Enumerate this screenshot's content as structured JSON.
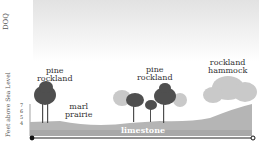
{
  "corner_label": "DOQ",
  "y_axis_label": "Feet above Sea Level",
  "y_ticks": [
    "7",
    "6",
    "5",
    "4"
  ],
  "habitats": [
    {
      "name": "pine rockland",
      "line1": "pine",
      "line2": "rockland"
    },
    {
      "name": "marl prairie",
      "line1": "marl",
      "line2": "prairie"
    },
    {
      "name": "pine rockland",
      "line1": "pine",
      "line2": "rockland"
    },
    {
      "name": "rockland hammock",
      "line1": "rockland",
      "line2": "hammock"
    }
  ],
  "substrate_label": "limestone",
  "colors": {
    "ground": "#b5b5b5",
    "tree_dark": "#4a4a4a",
    "tree_light": "#b8b8b8",
    "sky": "#e2e2e2"
  }
}
